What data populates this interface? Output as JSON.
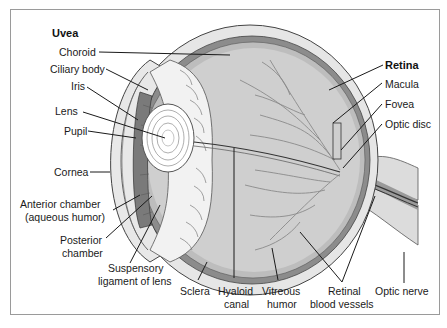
{
  "diagram": {
    "type": "anatomical-cross-section",
    "groups": {
      "uvea": {
        "title": "Uvea",
        "parts": [
          "Choroid",
          "Ciliary body",
          "Iris"
        ]
      },
      "retina": {
        "title": "Retina",
        "parts": [
          "Macula",
          "Fovea",
          "Optic disc"
        ]
      }
    },
    "labels": {
      "uvea": "Uvea",
      "choroid": "Choroid",
      "ciliary_body": "Ciliary body",
      "iris": "Iris",
      "lens": "Lens",
      "pupil": "Pupil",
      "cornea": "Cornea",
      "anterior_chamber_1": "Anterior chamber",
      "anterior_chamber_2": "(aqueous humor)",
      "posterior_chamber_1": "Posterior",
      "posterior_chamber_2": "chamber",
      "suspensory_1": "Suspensory",
      "suspensory_2": "ligament of lens",
      "sclera": "Sclera",
      "hyaloid_1": "Hyaloid",
      "hyaloid_2": "canal",
      "vitreous_1": "Vitreous",
      "vitreous_2": "humor",
      "retinal_vessels_1": "Retinal",
      "retinal_vessels_2": "blood vessels",
      "optic_nerve": "Optic nerve",
      "retina": "Retina",
      "macula": "Macula",
      "fovea": "Fovea",
      "optic_disc": "Optic disc"
    },
    "colors": {
      "sclera": "#e6e6e6",
      "choroid": "#8c8c8c",
      "retina_layer": "#bdbdbd",
      "vitreous": "#cfcfcf",
      "iris": "#7a7a7a",
      "lens": "#ffffff",
      "ciliary": "#f2f2f2",
      "lines": "#1a1a1a",
      "frame": "#9a9a9a"
    }
  }
}
